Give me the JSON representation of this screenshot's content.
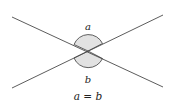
{
  "diagram": {
    "labels": {
      "top_angle": "a",
      "bottom_angle": "b",
      "equation": "a = b"
    },
    "colors": {
      "line": "#4a4a4a",
      "angle_fill": "#e2e2e2",
      "angle_stroke": "#3a3a3a",
      "text": "#222222"
    }
  }
}
